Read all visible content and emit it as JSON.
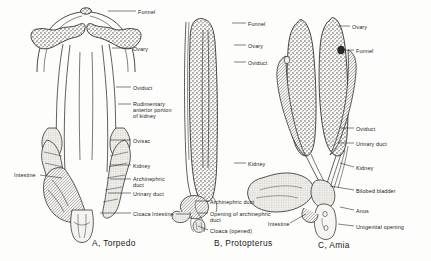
{
  "figure": {
    "background_color": "#fdfdfc",
    "ink_color": "#1b1b1b"
  },
  "panels": [
    {
      "id": "A",
      "caption": "A, Torpedo",
      "caption_x": 92,
      "caption_y": 238,
      "labels": [
        {
          "text": "Funnel",
          "x": 138,
          "y": 9,
          "align": "left",
          "leader": [
            [
              136,
              11
            ],
            [
              108,
              11
            ]
          ]
        },
        {
          "text": "Ovary",
          "x": 133,
          "y": 46,
          "align": "left",
          "leader": [
            [
              131,
              48
            ],
            [
              112,
              48
            ]
          ]
        },
        {
          "text": "Oviduct",
          "x": 133,
          "y": 85,
          "align": "left",
          "leader": [
            [
              131,
              87
            ],
            [
              116,
              87
            ]
          ]
        },
        {
          "text": "Rudimentary\nanterior portion\nof kidney",
          "x": 133,
          "y": 101,
          "align": "left",
          "leader": [
            [
              131,
              104
            ],
            [
              118,
              104
            ]
          ]
        },
        {
          "text": "Ovisac",
          "x": 133,
          "y": 138,
          "align": "left",
          "leader": [
            [
              131,
              140
            ],
            [
              110,
              140
            ]
          ]
        },
        {
          "text": "Kidney",
          "x": 133,
          "y": 163,
          "align": "left",
          "leader": [
            [
              131,
              165
            ],
            [
              110,
              165
            ]
          ]
        },
        {
          "text": "Archinephric\nduct",
          "x": 133,
          "y": 176,
          "align": "left",
          "leader": [
            [
              131,
              179
            ],
            [
              110,
              179
            ]
          ]
        },
        {
          "text": "Urinary duct",
          "x": 133,
          "y": 191,
          "align": "left",
          "leader": [
            [
              131,
              193
            ],
            [
              108,
              193
            ]
          ]
        },
        {
          "text": "Cloaca",
          "x": 133,
          "y": 211,
          "align": "left",
          "leader": [
            [
              131,
              213
            ],
            [
              100,
              213
            ]
          ]
        },
        {
          "text": "Intestine",
          "x": 14,
          "y": 172,
          "align": "left",
          "leader": [
            [
              40,
              175
            ],
            [
              62,
              178
            ]
          ]
        }
      ]
    },
    {
      "id": "B",
      "caption": "B, Protopterus",
      "caption_x": 214,
      "caption_y": 238,
      "labels": [
        {
          "text": "Funnel",
          "x": 248,
          "y": 21,
          "align": "left",
          "leader": [
            [
              246,
              23
            ],
            [
              232,
              23
            ]
          ]
        },
        {
          "text": "Ovary",
          "x": 248,
          "y": 43,
          "align": "left",
          "leader": [
            [
              246,
              45
            ],
            [
              234,
              45
            ]
          ]
        },
        {
          "text": "Oviduct",
          "x": 248,
          "y": 60,
          "align": "left",
          "leader": [
            [
              246,
              62
            ],
            [
              234,
              62
            ]
          ]
        },
        {
          "text": "Kidney",
          "x": 248,
          "y": 161,
          "align": "left",
          "leader": [
            [
              246,
              163
            ],
            [
              234,
              163
            ]
          ]
        },
        {
          "text": "Archinephric duct",
          "x": 210,
          "y": 199,
          "align": "left",
          "leader": [
            [
              208,
              201
            ],
            [
              196,
              201
            ]
          ]
        },
        {
          "text": "Opening of archinephric\nduct",
          "x": 210,
          "y": 211,
          "align": "left",
          "leader": [
            [
              208,
              213
            ],
            [
              198,
              213
            ]
          ]
        },
        {
          "text": "Cloaca (opened)",
          "x": 210,
          "y": 228,
          "align": "left",
          "leader": [
            [
              208,
              230
            ],
            [
              198,
              226
            ]
          ]
        },
        {
          "text": "Intestine",
          "x": 152,
          "y": 211,
          "align": "left",
          "leader": [
            [
              176,
              214
            ],
            [
              190,
              214
            ]
          ]
        }
      ]
    },
    {
      "id": "C",
      "caption": "C, Amia",
      "caption_x": 318,
      "caption_y": 240,
      "labels": [
        {
          "text": "Ovary",
          "x": 352,
          "y": 24,
          "align": "left",
          "leader": [
            [
              350,
              26
            ],
            [
              338,
              26
            ]
          ]
        },
        {
          "text": "Funnel",
          "x": 356,
          "y": 48,
          "align": "left",
          "leader": [
            [
              354,
              50
            ],
            [
              342,
              50
            ]
          ]
        },
        {
          "text": "Oviduct",
          "x": 356,
          "y": 126,
          "align": "left",
          "leader": [
            [
              354,
              128
            ],
            [
              340,
              128
            ]
          ]
        },
        {
          "text": "Urinary duct",
          "x": 356,
          "y": 141,
          "align": "left",
          "leader": [
            [
              354,
              143
            ],
            [
              338,
              143
            ]
          ]
        },
        {
          "text": "Kidney",
          "x": 356,
          "y": 165,
          "align": "left",
          "leader": [
            [
              354,
              167
            ],
            [
              340,
              163
            ]
          ]
        },
        {
          "text": "Bilobed bladder",
          "x": 356,
          "y": 188,
          "align": "left",
          "leader": [
            [
              354,
              190
            ],
            [
              330,
              186
            ]
          ]
        },
        {
          "text": "Anus",
          "x": 356,
          "y": 208,
          "align": "left",
          "leader": [
            [
              354,
              210
            ],
            [
              340,
              207
            ]
          ]
        },
        {
          "text": "Urogenital opening",
          "x": 356,
          "y": 224,
          "align": "left",
          "leader": [
            [
              354,
              226
            ],
            [
              338,
              224
            ]
          ]
        },
        {
          "text": "Intestine",
          "x": 268,
          "y": 221,
          "align": "left",
          "leader": [
            [
              290,
              223
            ],
            [
              306,
              214
            ]
          ]
        }
      ]
    }
  ]
}
